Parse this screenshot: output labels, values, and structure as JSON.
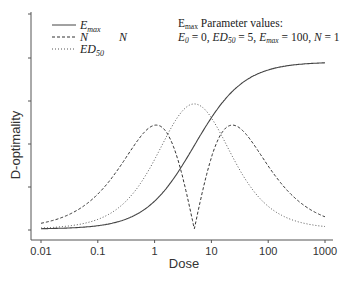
{
  "chart_data": {
    "type": "line",
    "title": "",
    "xlabel": "Dose",
    "ylabel": "D-optimality",
    "xscale": "log",
    "xlim": [
      0.01,
      1000
    ],
    "x_ticks": [
      "0.01",
      "0.1",
      "1",
      "10",
      "100",
      "1000"
    ],
    "y_ticks_labeled": false,
    "grid": false,
    "legend_position": "top-left",
    "x": [
      0.01,
      0.03,
      0.1,
      0.3,
      1,
      2,
      3,
      5,
      8,
      12,
      20,
      30,
      50,
      100,
      200,
      500,
      1000
    ],
    "series": [
      {
        "name": "E_max",
        "style": "solid",
        "color": "#444444",
        "values": [
          0.002,
          0.006,
          0.02,
          0.057,
          0.167,
          0.286,
          0.375,
          0.5,
          0.615,
          0.706,
          0.8,
          0.857,
          0.909,
          0.952,
          0.976,
          0.99,
          0.995
        ]
      },
      {
        "name": "N",
        "style": "dashed",
        "color": "#333333",
        "values": [
          0.034,
          0.084,
          0.209,
          0.418,
          0.622,
          0.52,
          0.333,
          0.0,
          0.31,
          0.505,
          0.617,
          0.61,
          0.53,
          0.378,
          0.244,
          0.125,
          0.073
        ]
      },
      {
        "name": "ED_50",
        "style": "dotted",
        "color": "#555555",
        "values": [
          0.006,
          0.018,
          0.058,
          0.16,
          0.416,
          0.611,
          0.702,
          0.749,
          0.709,
          0.648,
          0.479,
          0.367,
          0.248,
          0.136,
          0.07,
          0.029,
          0.015
        ]
      }
    ],
    "annotations": [
      "E_max Parameter values:",
      "E_0 = 0, ED_50 = 5, E_max = 100, N = 1",
      "N"
    ]
  },
  "legend": {
    "items": [
      {
        "label_main": "E",
        "label_sub": "max"
      },
      {
        "label_main": "N",
        "label_sub": ""
      },
      {
        "label_main": "ED",
        "label_sub": "50"
      }
    ],
    "floating_label": "N"
  },
  "annotation": {
    "line1_main": "E",
    "line1_sub": "max",
    "line1_rest": " Parameter values:",
    "line2": {
      "e0": "E",
      "e0_sub": "0",
      "e0_val": " = 0, ",
      "ed": "ED",
      "ed_sub": "50",
      "ed_val": " = 5, ",
      "em": "E",
      "em_sub": "max",
      "em_val": " = 100, ",
      "n": "N",
      "n_val": " = 1"
    }
  },
  "axes": {
    "xlabel": "Dose",
    "ylabel": "D-optimality",
    "x_tick_labels": [
      "0.01",
      "0.1",
      "1",
      "10",
      "100",
      "1000"
    ]
  }
}
